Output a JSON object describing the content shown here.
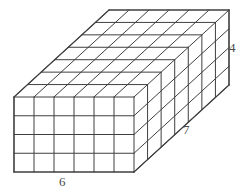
{
  "figure": {
    "name": "rectangular-prism-unit-cubes",
    "type": "3d-geometry-diagram",
    "shape": "rectangular prism",
    "labels": {
      "width": "6",
      "depth": "7",
      "height": "4"
    },
    "dimensions": {
      "width_units": 6,
      "depth_units": 7,
      "height_units": 4,
      "total_unit_cubes": 168
    },
    "style": {
      "line_color": "#3f3f3f",
      "background": "#ffffff",
      "face_fill": "none",
      "label_color": "#4a4a4a",
      "stroke_width": 1
    },
    "geometry": {
      "front_top_left_x": 14,
      "front_top_left_y": 97,
      "unit_width_px": 20,
      "unit_height_px": 18.75,
      "depth_dx_px": 13.571,
      "depth_dy_px": -12.429
    }
  }
}
